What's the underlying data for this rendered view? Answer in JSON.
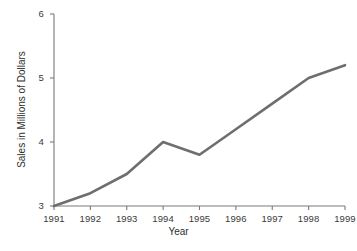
{
  "chart_data": {
    "type": "line",
    "title": "",
    "xlabel": "Year",
    "ylabel": "Sales in Millions of Dollars",
    "categories": [
      "1991",
      "1992",
      "1993",
      "1994",
      "1995",
      "1996",
      "1997",
      "1998",
      "1999"
    ],
    "x": [
      1991,
      1992,
      1993,
      1994,
      1995,
      1996,
      1997,
      1998,
      1999
    ],
    "values": [
      3.0,
      3.2,
      3.5,
      4.0,
      3.8,
      4.2,
      4.6,
      5.0,
      5.2
    ],
    "series": [
      {
        "name": "Sales",
        "values": [
          3.0,
          3.2,
          3.5,
          4.0,
          3.8,
          4.2,
          4.6,
          5.0,
          5.2
        ]
      }
    ],
    "xlim": [
      1991,
      1999
    ],
    "ylim": [
      3,
      6
    ],
    "yticks": [
      3,
      4,
      5,
      6
    ],
    "ytick_labels": [
      "3",
      "4",
      "5",
      "6"
    ],
    "xticks": [
      1991,
      1992,
      1993,
      1994,
      1995,
      1996,
      1997,
      1998,
      1999
    ],
    "xtick_labels": [
      "1991",
      "1992",
      "1993",
      "1994",
      "1995",
      "1996",
      "1997",
      "1998",
      "1999"
    ],
    "grid": false,
    "legend": false,
    "legend_position": "none",
    "line_color": "#6e6e6e",
    "axis_color": "#7a7a7a",
    "background_color": "#ffffff",
    "annotations": []
  },
  "axes": {
    "y": {
      "label": "Sales in Millions of Dollars",
      "ticks": [
        {
          "label": "6",
          "value": 6
        },
        {
          "label": "5",
          "value": 5
        },
        {
          "label": "4",
          "value": 4
        },
        {
          "label": "3",
          "value": 3
        }
      ]
    },
    "x": {
      "label": "Year",
      "ticks": [
        {
          "label": "1991",
          "value": 1991
        },
        {
          "label": "1992",
          "value": 1992
        },
        {
          "label": "1993",
          "value": 1993
        },
        {
          "label": "1994",
          "value": 1994
        },
        {
          "label": "1995",
          "value": 1995
        },
        {
          "label": "1996",
          "value": 1996
        },
        {
          "label": "1997",
          "value": 1997
        },
        {
          "label": "1998",
          "value": 1998
        },
        {
          "label": "1999",
          "value": 1999
        }
      ]
    }
  }
}
